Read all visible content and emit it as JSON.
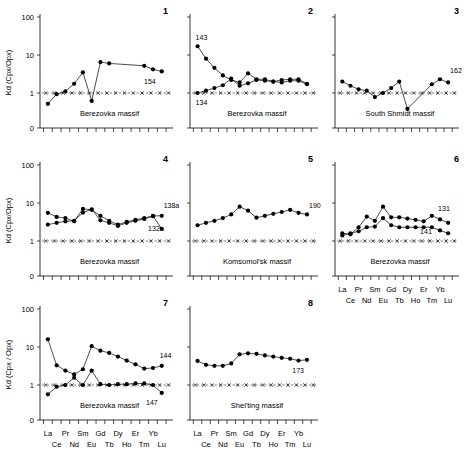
{
  "figure": {
    "ylabel": "Kd (Cpx/Opx)",
    "ylabel_alt": "Kd (Cpx / Opx)",
    "y_ticks": [
      "100",
      "10",
      "1",
      "0"
    ],
    "x_ticks_top": [
      "La",
      "Pr",
      "Sm",
      "Gd",
      "Dy",
      "Er",
      "Yb"
    ],
    "x_ticks_bottom": [
      "Ce",
      "Nd",
      "Eu",
      "Tb",
      "Ho",
      "Tm",
      "Lu"
    ],
    "elements": [
      "La",
      "Ce",
      "Pr",
      "Nd",
      "Sm",
      "Eu",
      "Gd",
      "Tb",
      "Dy",
      "Ho",
      "Er",
      "Tm",
      "Yb",
      "Lu"
    ],
    "unity_value": 1
  },
  "chart_data": [
    {
      "type": "line",
      "panel": "1",
      "title": "Berezovka massif",
      "ylabel": "Kd (Cpx/Opx)",
      "xlabel": "",
      "ylim": [
        0.3,
        100
      ],
      "categories": [
        "La",
        "Ce",
        "Pr",
        "Nd",
        "Sm",
        "Eu",
        "Gd",
        "Tb",
        "Dy",
        "Ho",
        "Er",
        "Tm",
        "Yb",
        "Lu"
      ],
      "series": [
        {
          "name": "154",
          "label_visible": "154",
          "values": [
            0.52,
            0.93,
            1.1,
            1.75,
            3.5,
            0.62,
            6.5,
            6.0,
            null,
            null,
            null,
            5.2,
            4.2,
            3.7
          ]
        }
      ],
      "reference_line": 1,
      "grid": false,
      "legend": "inline-label"
    },
    {
      "type": "line",
      "panel": "2",
      "title": "Berezovka massif",
      "ylabel": "",
      "xlabel": "",
      "ylim": [
        0.3,
        100
      ],
      "categories": [
        "La",
        "Ce",
        "Pr",
        "Nd",
        "Sm",
        "Eu",
        "Gd",
        "Tb",
        "Dy",
        "Ho",
        "Er",
        "Tm",
        "Yb",
        "Lu"
      ],
      "series": [
        {
          "name": "143",
          "label_visible": "143",
          "values": [
            17.0,
            8.0,
            4.6,
            2.9,
            2.2,
            1.9,
            3.3,
            2.3,
            2.3,
            2.0,
            1.9,
            2.1,
            2.1,
            1.7
          ]
        },
        {
          "name": "134",
          "label_visible": "134",
          "values": [
            1.0,
            1.15,
            1.35,
            1.6,
            2.4,
            1.55,
            1.8,
            2.2,
            2.1,
            2.0,
            2.2,
            2.3,
            2.3,
            1.75
          ]
        }
      ],
      "reference_line": 1,
      "grid": false,
      "legend": "inline-label"
    },
    {
      "type": "line",
      "panel": "3",
      "title": "South Shmidt massif",
      "ylabel": "",
      "xlabel": "",
      "ylim": [
        0.3,
        100
      ],
      "categories": [
        "La",
        "Ce",
        "Pr",
        "Nd",
        "Sm",
        "Eu",
        "Gd",
        "Tb",
        "Dy",
        "Ho",
        "Er",
        "Tm",
        "Yb",
        "Lu"
      ],
      "series": [
        {
          "name": "162",
          "label_visible": "162",
          "values": [
            2.0,
            1.55,
            1.25,
            1.15,
            0.78,
            1.0,
            1.35,
            2.0,
            0.38,
            null,
            null,
            1.7,
            2.3,
            1.9,
            2.4
          ]
        }
      ],
      "reference_line": 1,
      "grid": false,
      "legend": "inline-label"
    },
    {
      "type": "line",
      "panel": "4",
      "title": "Berezovka massif",
      "ylabel": "Kd (Cpx/Opx)",
      "xlabel": "",
      "ylim": [
        0.3,
        100
      ],
      "categories": [
        "La",
        "Ce",
        "Pr",
        "Nd",
        "Sm",
        "Eu",
        "Gd",
        "Tb",
        "Dy",
        "Ho",
        "Er",
        "Tm",
        "Yb",
        "Lu"
      ],
      "series": [
        {
          "name": "138a",
          "label_visible": "138a",
          "values": [
            5.5,
            4.3,
            4.0,
            3.3,
            7.0,
            6.6,
            4.6,
            3.4,
            2.7,
            3.2,
            3.6,
            4.0,
            4.6,
            4.6
          ]
        },
        {
          "name": "132a",
          "label_visible": "132a",
          "values": [
            2.7,
            3.0,
            3.3,
            3.4,
            5.6,
            6.8,
            3.5,
            3.0,
            2.5,
            3.0,
            3.4,
            3.8,
            4.5,
            2.1
          ]
        }
      ],
      "reference_line": 1,
      "grid": false,
      "legend": "inline-label"
    },
    {
      "type": "line",
      "panel": "5",
      "title": "Komsomol'sk massif",
      "ylabel": "",
      "xlabel": "",
      "ylim": [
        0.3,
        100
      ],
      "categories": [
        "La",
        "Ce",
        "Pr",
        "Nd",
        "Sm",
        "Eu",
        "Gd",
        "Tb",
        "Dy",
        "Ho",
        "Er",
        "Tm",
        "Yb",
        "Lu"
      ],
      "series": [
        {
          "name": "190",
          "label_visible": "190",
          "values": [
            2.6,
            3.0,
            3.4,
            4.0,
            5.0,
            8.0,
            6.3,
            4.1,
            4.6,
            5.2,
            5.8,
            6.6,
            5.5,
            5.0
          ]
        }
      ],
      "reference_line": 1,
      "grid": false,
      "legend": "inline-label"
    },
    {
      "type": "line",
      "panel": "6",
      "title": "Berezovka massif",
      "ylabel": "",
      "xlabel": "",
      "ylim": [
        0.3,
        100
      ],
      "categories": [
        "La",
        "Ce",
        "Pr",
        "Nd",
        "Sm",
        "Eu",
        "Gd",
        "Tb",
        "Dy",
        "Ho",
        "Er",
        "Tm",
        "Yb",
        "Lu"
      ],
      "series": [
        {
          "name": "131",
          "label_visible": "131",
          "values": [
            1.6,
            1.5,
            2.3,
            4.4,
            3.4,
            8.0,
            4.2,
            4.2,
            3.9,
            3.6,
            3.3,
            4.6,
            3.7,
            3.0
          ]
        },
        {
          "name": "141",
          "label_visible": "141",
          "values": [
            1.4,
            1.6,
            1.8,
            2.3,
            2.4,
            4.0,
            2.6,
            2.3,
            2.3,
            2.3,
            2.3,
            2.3,
            1.9,
            1.6
          ]
        }
      ],
      "reference_line": 1,
      "grid": false,
      "legend": "inline-label"
    },
    {
      "type": "line",
      "panel": "7",
      "title": "Berezovka massif",
      "ylabel": "Kd (Cpx / Opx)",
      "xlabel": "",
      "ylim": [
        0.3,
        100
      ],
      "categories": [
        "La",
        "Ce",
        "Pr",
        "Nd",
        "Sm",
        "Eu",
        "Gd",
        "Tb",
        "Dy",
        "Ho",
        "Er",
        "Tm",
        "Yb",
        "Lu"
      ],
      "series": [
        {
          "name": "144",
          "label_visible": "144",
          "values": [
            16.0,
            3.3,
            2.4,
            1.9,
            2.6,
            10.5,
            8.0,
            7.0,
            5.6,
            4.4,
            3.5,
            2.7,
            2.8,
            3.2
          ]
        },
        {
          "name": "147",
          "label_visible": "147",
          "values": [
            0.57,
            0.9,
            1.0,
            1.55,
            1.0,
            2.4,
            1.05,
            1.0,
            1.05,
            1.05,
            1.1,
            1.1,
            1.0,
            0.62
          ]
        }
      ],
      "reference_line": 1,
      "grid": false,
      "legend": "inline-label"
    },
    {
      "type": "line",
      "panel": "8",
      "title": "Shel'ting massif",
      "ylabel": "",
      "xlabel": "",
      "ylim": [
        0.3,
        100
      ],
      "categories": [
        "La",
        "Ce",
        "Pr",
        "Nd",
        "Sm",
        "Eu",
        "Gd",
        "Tb",
        "Dy",
        "Ho",
        "Er",
        "Tm",
        "Yb",
        "Lu"
      ],
      "series": [
        {
          "name": "173",
          "label_visible": "173",
          "values": [
            4.3,
            3.4,
            3.2,
            3.2,
            3.7,
            6.4,
            6.8,
            6.6,
            6.0,
            5.6,
            5.2,
            4.9,
            4.4,
            4.6
          ]
        }
      ],
      "reference_line": 1,
      "grid": false,
      "legend": "inline-label"
    }
  ]
}
